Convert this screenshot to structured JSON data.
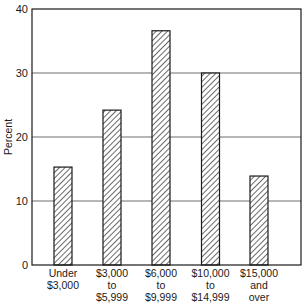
{
  "chart_data": {
    "type": "bar",
    "title": "",
    "xlabel": "",
    "ylabel": "Percent",
    "ylim": [
      0,
      40
    ],
    "yticks": [
      0,
      10,
      20,
      30,
      40
    ],
    "grid": {
      "horizontal": true,
      "vertical": false
    },
    "legend": null,
    "bar_style": "diagonal-hatch",
    "categories": [
      [
        "Under",
        "$3,000"
      ],
      [
        "$3,000",
        "to",
        "$5,999"
      ],
      [
        "$6,000",
        "to",
        "$9,999"
      ],
      [
        "$10,000",
        "to",
        "$14,999"
      ],
      [
        "$15,000",
        "and",
        "over"
      ]
    ],
    "category_labels": [
      "Under $3,000",
      "$3,000 to $5,999",
      "$6,000 to $9,999",
      "$10,000 to $14,999",
      "$15,000 and over"
    ],
    "values": [
      15.3,
      24.2,
      36.6,
      30.0,
      13.9
    ]
  },
  "colors": {
    "ink": "#1a1a1a",
    "grid": "#6e6e6e",
    "background": "#ffffff"
  }
}
